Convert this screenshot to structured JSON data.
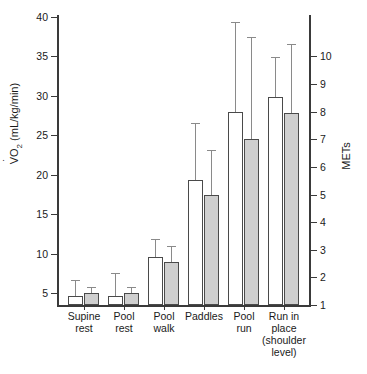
{
  "chart_data": {
    "type": "bar",
    "title": "",
    "xlabel": "",
    "ylabel": "VO2 (mL/kg/min)",
    "ylabel_secondary": "METs",
    "ylim": [
      3.5,
      40
    ],
    "ylim_secondary": [
      0.7,
      10
    ],
    "grid": false,
    "legend": "none",
    "categories": [
      "Supine\nrest",
      "Pool\nrest",
      "Pool\nwalk",
      "Paddles",
      "Pool\nrun",
      "Run in\nplace\n(shoulder\nlevel)"
    ],
    "series": [
      {
        "name": "open-bar",
        "fill": "#ffffff",
        "values": [
          4.7,
          4.7,
          9.6,
          19.4,
          28.0,
          29.8
        ],
        "errors_upper": [
          6.6,
          7.4,
          11.8,
          26.5,
          39.2,
          34.8
        ]
      },
      {
        "name": "shaded-bar",
        "fill": "#cfcfcf",
        "values": [
          5.0,
          5.0,
          8.9,
          17.4,
          24.6,
          27.8
        ],
        "errors_upper": [
          5.6,
          5.6,
          10.8,
          23.0,
          37.3,
          36.4
        ]
      }
    ],
    "yticks": [
      5,
      10,
      15,
      20,
      25,
      30,
      35,
      40
    ],
    "yticks_secondary": [
      1,
      2,
      3,
      4,
      5,
      6,
      7,
      8,
      9,
      10
    ],
    "ytick_labels": [
      "5",
      "10",
      "15",
      "20",
      "25",
      "30",
      "35",
      "40"
    ],
    "ytick_labels_secondary": [
      "1",
      "2",
      "3",
      "4",
      "5",
      "6",
      "7",
      "8",
      "9",
      "10"
    ]
  },
  "axes": {
    "left_title_prefix": "V",
    "left_title_sub": "O",
    "left_title_sub2": "2",
    "left_title_suffix": " (mL/kg/min)",
    "right_title": "METs"
  }
}
